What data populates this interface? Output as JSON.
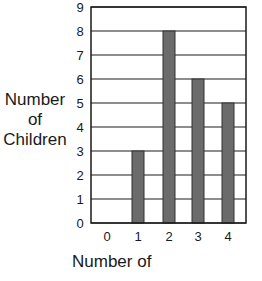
{
  "chart_data": {
    "type": "bar",
    "title": "",
    "xlabel": "Number of",
    "ylabel": "Number of Children",
    "ylabel_lines": [
      "Number",
      "of",
      "Children"
    ],
    "categories": [
      "0",
      "1",
      "2",
      "3",
      "4"
    ],
    "values": [
      0,
      3,
      8,
      6,
      5
    ],
    "yticks": [
      "0",
      "1",
      "2",
      "3",
      "4",
      "5",
      "6",
      "7",
      "8",
      "9"
    ],
    "ylim": [
      0,
      9
    ],
    "grid": true,
    "bar_color": "#6b6b6b"
  }
}
